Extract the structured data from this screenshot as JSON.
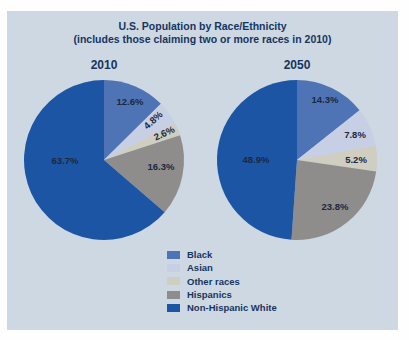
{
  "panel": {
    "title_line1": "U.S. Population by Race/Ethnicity",
    "title_line2": "(includes those claiming two or more races in 2010)"
  },
  "colors": {
    "page_bg": "#fefefe",
    "panel_bg": "#cdd8e3",
    "title_text": "#16355e",
    "slice_label_text": "#1b2840"
  },
  "chart_data": [
    {
      "type": "pie",
      "title": "2010",
      "categories": [
        "Black",
        "Asian",
        "Other races",
        "Hispanics",
        "Non-Hispanic White"
      ],
      "values": [
        12.6,
        4.8,
        2.6,
        16.3,
        63.7
      ],
      "labels": [
        "12.6%",
        "4.8%",
        "2.6%",
        "16.3%",
        "63.7%"
      ],
      "colors": [
        "#4f74b5",
        "#c6cfe4",
        "#d0cdc1",
        "#8e8d8b",
        "#1d55a5"
      ],
      "start_angle": "12 o'clock",
      "direction": "clockwise"
    },
    {
      "type": "pie",
      "title": "2050",
      "categories": [
        "Black",
        "Asian",
        "Other races",
        "Hispanics",
        "Non-Hispanic White"
      ],
      "values": [
        14.3,
        7.8,
        5.2,
        23.8,
        48.9
      ],
      "labels": [
        "14.3%",
        "7.8%",
        "5.2%",
        "23.8%",
        "48.9%"
      ],
      "colors": [
        "#4f74b5",
        "#c6cfe4",
        "#d0cdc1",
        "#8e8d8b",
        "#1d55a5"
      ],
      "start_angle": "12 o'clock",
      "direction": "clockwise"
    }
  ],
  "legend": {
    "items": [
      {
        "label": "Black",
        "color": "#4f74b5"
      },
      {
        "label": "Asian",
        "color": "#c6cfe4"
      },
      {
        "label": "Other races",
        "color": "#d0cdc1"
      },
      {
        "label": "Hispanics",
        "color": "#8e8d8b"
      },
      {
        "label": "Non-Hispanic White",
        "color": "#1d55a5"
      }
    ]
  }
}
